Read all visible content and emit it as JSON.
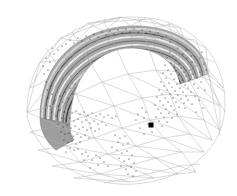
{
  "figure": {
    "title": "",
    "caption": "",
    "background_color": "#ffffff",
    "width": 237,
    "height": 196
  },
  "wireframe": {
    "name": "outer-mesh",
    "stroke_color": "#b4b4b4",
    "stroke_width": 0.5,
    "style": "triangulated-dome",
    "visible": true
  },
  "inner_surface": {
    "name": "banded-arc-surface",
    "fill_color": "#a8a8a8",
    "band_light": "#e8e8e8",
    "band_dark": "#4a4a4a",
    "band_count": 9,
    "style": "concentric-arcs",
    "visible": true
  },
  "point_cloud": {
    "name": "scatter-points",
    "color": "#1a1a1a",
    "point_radius": 0.55,
    "count": 1400,
    "visible": true
  },
  "marker": {
    "name": "highlight-marker",
    "color": "#000000",
    "x": 151,
    "y": 125,
    "size": 5,
    "shape": "square",
    "visible": true
  },
  "chart_data": {
    "type": "scatter",
    "title": "",
    "xlabel": "",
    "ylabel": "",
    "xlim": [
      0,
      237
    ],
    "ylim": [
      0,
      196
    ],
    "grid": false,
    "legend": "none",
    "series": [
      {
        "name": "scatter-cloud",
        "color": "#1a1a1a",
        "point_count": 1400
      },
      {
        "name": "highlight-marker",
        "color": "#000000",
        "point_count": 1,
        "values": [
          [
            151,
            125
          ]
        ]
      }
    ]
  }
}
